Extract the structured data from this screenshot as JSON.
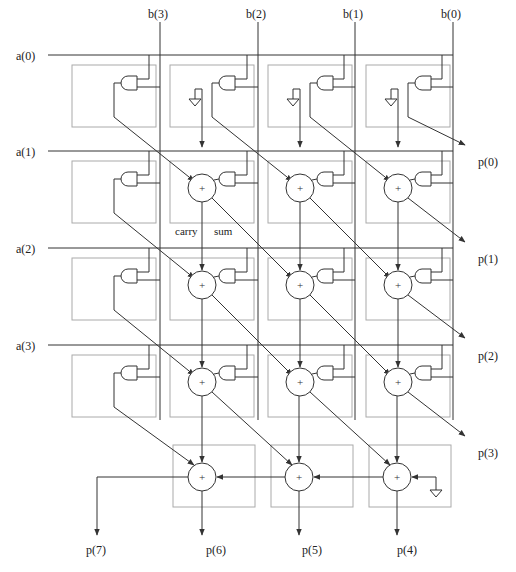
{
  "inputs_b": [
    {
      "label": "b(3)",
      "x": 160
    },
    {
      "label": "b(2)",
      "x": 258
    },
    {
      "label": "b(1)",
      "x": 355
    },
    {
      "label": "b(0)",
      "x": 453
    }
  ],
  "inputs_a": [
    {
      "label": "a(0)",
      "y": 55
    },
    {
      "label": "a(1)",
      "y": 151
    },
    {
      "label": "a(2)",
      "y": 248
    },
    {
      "label": "a(3)",
      "y": 345
    }
  ],
  "outputs_right": [
    {
      "label": "p(0)"
    },
    {
      "label": "p(1)"
    },
    {
      "label": "p(2)"
    },
    {
      "label": "p(3)"
    }
  ],
  "outputs_bottom": [
    {
      "label": "p(7)"
    },
    {
      "label": "p(6)"
    },
    {
      "label": "p(5)"
    },
    {
      "label": "p(4)"
    }
  ],
  "annotations": {
    "carry": "carry",
    "sum": "sum"
  },
  "adder_symbol": "+",
  "colors": {
    "wire": "#333333",
    "cell_border": "#aaaaaa",
    "background": "#ffffff"
  }
}
